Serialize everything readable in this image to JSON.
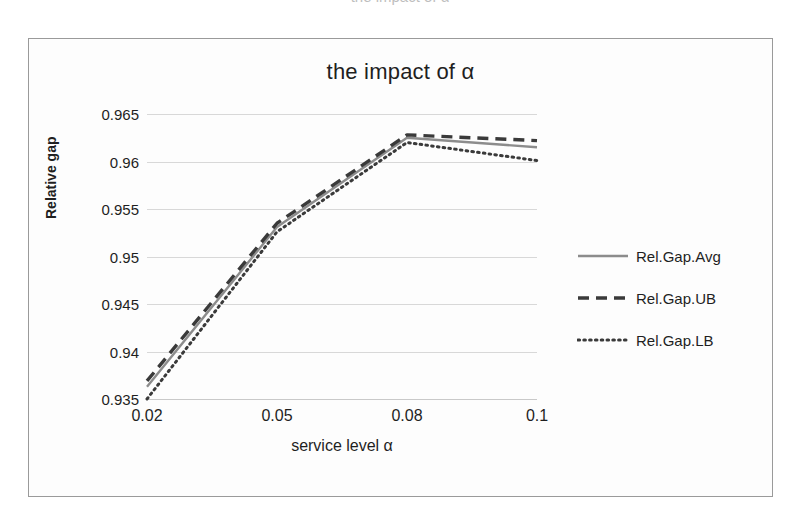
{
  "scan": {
    "top_artifact_text": "the impact of α"
  },
  "chart_data": {
    "type": "line",
    "title": "the impact of α",
    "xlabel": "service level α",
    "ylabel": "Relative gap",
    "x": [
      0.02,
      0.05,
      0.08,
      0.1
    ],
    "xtick_labels": [
      "0.02",
      "0.05",
      "0.08",
      "0.1"
    ],
    "ytick_labels": [
      "0.965",
      "0.96",
      "0.955",
      "0.95",
      "0.945",
      "0.94",
      "0.935"
    ],
    "ytick_values": [
      0.965,
      0.96,
      0.955,
      0.95,
      0.945,
      0.94,
      0.935
    ],
    "ylim": [
      0.935,
      0.965
    ],
    "xlim": [
      0.02,
      0.1
    ],
    "grid": true,
    "grid_axis": "y",
    "legend_position": "right",
    "series": [
      {
        "name": "Rel.Gap.Avg",
        "style": "solid",
        "color": "#8c8c8c",
        "values": [
          0.9363,
          0.9531,
          0.9625,
          0.9615
        ]
      },
      {
        "name": "Rel.Gap.UB",
        "style": "dashed",
        "color": "#3a3a3a",
        "values": [
          0.9369,
          0.9535,
          0.9628,
          0.9622
        ]
      },
      {
        "name": "Rel.Gap.LB",
        "style": "dotted",
        "color": "#3a3a3a",
        "values": [
          0.935,
          0.9526,
          0.962,
          0.9601
        ]
      }
    ]
  },
  "legend": {
    "items": [
      {
        "label": "Rel.Gap.Avg"
      },
      {
        "label": "Rel.Gap.UB"
      },
      {
        "label": "Rel.Gap.LB"
      }
    ]
  }
}
